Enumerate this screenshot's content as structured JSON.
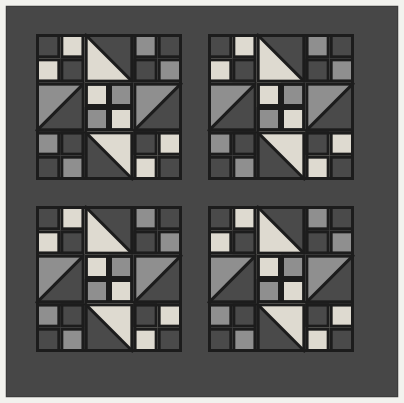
{
  "figure": {
    "caption": "Four-block quilt top with sashing and border",
    "width": 404,
    "height": 403
  },
  "palette": {
    "background": "#f2f2ee",
    "border_dark": "#474747",
    "sashing_dark": "#474747",
    "block_background": "#4a4a4a",
    "seam_line": "#1c1c1c",
    "fabric_light": "#dedad0",
    "fabric_medium": "#8f8f8f",
    "fabric_dark": "#4a4a4a",
    "outer_frame": "#3c3c3c"
  },
  "layout": {
    "outer_frame_inset": 6,
    "border_width": 30,
    "sashing_width": 26,
    "block_size": 146,
    "block_origin_x": 36,
    "block_origin_y": 34,
    "block_columns": 2,
    "block_rows": 2,
    "unit_grid": "3x3",
    "seam_width": 3
  },
  "blocks": [
    {
      "name": "block-top-left",
      "row": 0,
      "col": 0
    },
    {
      "name": "block-top-right",
      "row": 0,
      "col": 1
    },
    {
      "name": "block-bottom-left",
      "row": 1,
      "col": 0
    },
    {
      "name": "block-bottom-right",
      "row": 1,
      "col": 1
    }
  ],
  "block_units": [
    {
      "name": "corner-four-patch-top-left",
      "row": 0,
      "col": 0,
      "type": "four-patch",
      "colors": [
        "dark",
        "light",
        "light",
        "dark"
      ]
    },
    {
      "name": "half-square-triangle-top-center",
      "row": 0,
      "col": 1,
      "type": "half-square",
      "triangle": "lower-left",
      "colors": [
        "light",
        "dark"
      ]
    },
    {
      "name": "corner-four-patch-top-right",
      "row": 0,
      "col": 2,
      "type": "four-patch",
      "colors": [
        "medium",
        "dark",
        "dark",
        "medium"
      ]
    },
    {
      "name": "half-square-triangle-mid-left",
      "row": 1,
      "col": 0,
      "type": "half-square",
      "triangle": "lower-right",
      "colors": [
        "dark",
        "medium"
      ]
    },
    {
      "name": "center-four-patch",
      "row": 1,
      "col": 1,
      "type": "four-patch",
      "colors": [
        "light",
        "medium",
        "medium",
        "light"
      ]
    },
    {
      "name": "half-square-triangle-mid-right",
      "row": 1,
      "col": 2,
      "type": "half-square",
      "triangle": "upper-left",
      "colors": [
        "medium",
        "dark"
      ]
    },
    {
      "name": "corner-four-patch-bottom-left",
      "row": 2,
      "col": 0,
      "type": "four-patch",
      "colors": [
        "medium",
        "dark",
        "dark",
        "medium"
      ]
    },
    {
      "name": "half-square-triangle-bottom-ctr",
      "row": 2,
      "col": 1,
      "type": "half-square",
      "triangle": "upper-right",
      "colors": [
        "light",
        "dark"
      ]
    },
    {
      "name": "corner-four-patch-bottom-right",
      "row": 2,
      "col": 2,
      "type": "four-patch",
      "colors": [
        "dark",
        "light",
        "light",
        "dark"
      ]
    }
  ],
  "chart_data": {
    "type": "diagram",
    "block_count": 4,
    "units_per_block": 9,
    "patches_per_block": 24,
    "fabric_values": [
      "light",
      "medium",
      "dark"
    ],
    "legend": [
      {
        "label": "Light fabric",
        "color": "#dedad0"
      },
      {
        "label": "Medium fabric",
        "color": "#8f8f8f"
      },
      {
        "label": "Dark fabric",
        "color": "#4a4a4a"
      }
    ]
  }
}
